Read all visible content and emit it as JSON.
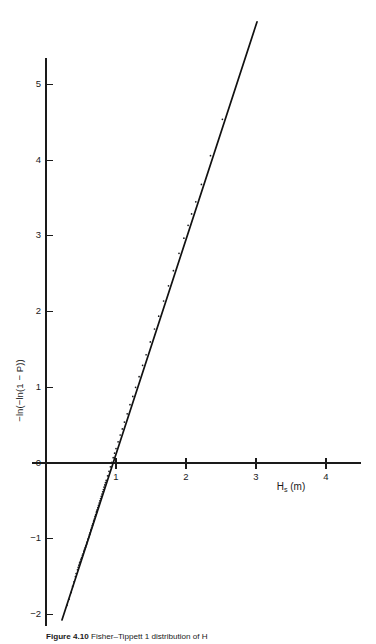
{
  "figure": {
    "caption_label": "Figure 4.10",
    "caption_body": "Fisher–Tippett 1 distribution of H",
    "caption_body_tail": "101",
    "background_color": "#ffffff",
    "ink_color": "#1a1a1a"
  },
  "axes": {
    "x": {
      "label_main": "H",
      "label_sub": "s",
      "label_unit": " (m)",
      "label_full": "Hs (m)",
      "ticks": [
        1,
        2,
        3,
        4
      ],
      "tick_labels": [
        "1",
        "2",
        "3",
        "4"
      ],
      "range": [
        -0.2,
        4.5
      ],
      "axis_row_value": 0
    },
    "y": {
      "label_full": "−ln(−ln(1 − P))",
      "ticks": [
        5,
        4,
        3,
        2,
        1,
        0,
        -1,
        -2
      ],
      "tick_labels": [
        "5",
        "4",
        "3",
        "2",
        "1",
        "0",
        "−1",
        "−2"
      ],
      "range": [
        -2.15,
        5.35
      ],
      "axis_col_value": 0
    }
  },
  "chart_data": {
    "type": "scatter",
    "title": "",
    "subtitle": "",
    "xlabel": "Hs (m)",
    "ylabel": "−ln(−ln(1 − P))",
    "xlim": [
      -0.2,
      4.5
    ],
    "ylim": [
      -2.15,
      5.35
    ],
    "grid": false,
    "legend": null,
    "xticks": [
      1,
      2,
      3,
      4
    ],
    "yticks": [
      5,
      4,
      3,
      2,
      1,
      0,
      -1,
      -2
    ],
    "series": [
      {
        "name": "Fisher–Tippett 1 fitted line",
        "type": "line",
        "points": [
          [
            0.228,
            -2.073
          ],
          [
            3.014,
            5.827
          ]
        ],
        "slope": 2.836,
        "intercept": -2.72,
        "x_at_y0": 0.959,
        "color": "#111111"
      },
      {
        "name": "Observed Hs order statistics",
        "type": "scatter",
        "marker": "dot",
        "color": "#15171a",
        "x": [
          0.3,
          0.33,
          0.36,
          0.38,
          0.4,
          0.42,
          0.43,
          0.45,
          0.46,
          0.47,
          0.48,
          0.49,
          0.5,
          0.51,
          0.52,
          0.53,
          0.54,
          0.545,
          0.55,
          0.56,
          0.565,
          0.57,
          0.58,
          0.585,
          0.59,
          0.6,
          0.605,
          0.61,
          0.62,
          0.625,
          0.63,
          0.64,
          0.645,
          0.65,
          0.66,
          0.665,
          0.67,
          0.68,
          0.685,
          0.69,
          0.7,
          0.705,
          0.71,
          0.72,
          0.725,
          0.73,
          0.74,
          0.75,
          0.76,
          0.77,
          0.78,
          0.79,
          0.8,
          0.81,
          0.82,
          0.83,
          0.84,
          0.85,
          0.86,
          0.88,
          0.9,
          0.92,
          0.94,
          0.96,
          0.98,
          1.0,
          1.03,
          1.06,
          1.09,
          1.12,
          1.16,
          1.2,
          1.24,
          1.28,
          1.33,
          1.38,
          1.43,
          1.49,
          1.55,
          1.61,
          1.68,
          1.75,
          1.82,
          1.9,
          1.97,
          2.03,
          2.08,
          2.14,
          2.22,
          2.35,
          2.52
        ],
        "y": [
          -1.88,
          -1.8,
          -1.71,
          -1.63,
          -1.57,
          -1.5,
          -1.46,
          -1.41,
          -1.38,
          -1.35,
          -1.32,
          -1.3,
          -1.27,
          -1.25,
          -1.22,
          -1.2,
          -1.17,
          -1.16,
          -1.14,
          -1.12,
          -1.11,
          -1.09,
          -1.07,
          -1.05,
          -1.04,
          -1.01,
          -1.0,
          -0.98,
          -0.95,
          -0.94,
          -0.92,
          -0.89,
          -0.88,
          -0.86,
          -0.83,
          -0.82,
          -0.8,
          -0.77,
          -0.76,
          -0.74,
          -0.71,
          -0.7,
          -0.68,
          -0.65,
          -0.64,
          -0.62,
          -0.59,
          -0.56,
          -0.53,
          -0.5,
          -0.47,
          -0.44,
          -0.41,
          -0.38,
          -0.35,
          -0.32,
          -0.29,
          -0.26,
          -0.23,
          -0.17,
          -0.11,
          -0.05,
          0.01,
          0.07,
          0.13,
          0.19,
          0.28,
          0.37,
          0.45,
          0.54,
          0.65,
          0.77,
          0.88,
          1.0,
          1.14,
          1.29,
          1.43,
          1.6,
          1.77,
          1.94,
          2.14,
          2.34,
          2.54,
          2.77,
          2.97,
          3.14,
          3.29,
          3.45,
          3.68,
          4.06,
          4.54
        ]
      }
    ]
  }
}
